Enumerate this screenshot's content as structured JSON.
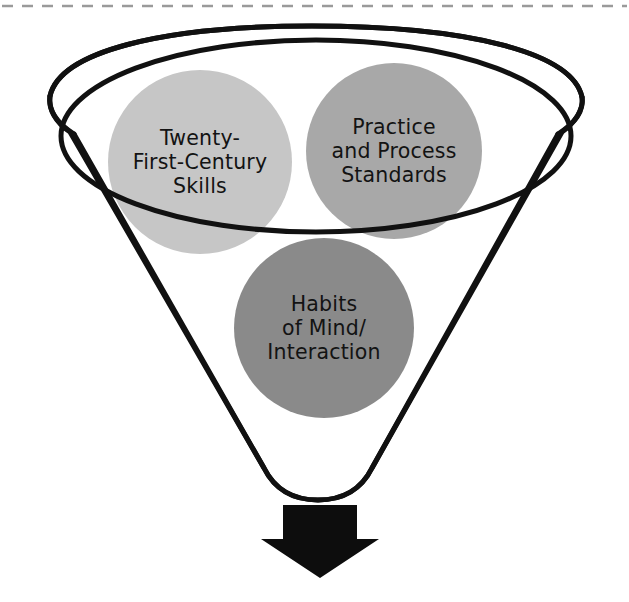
{
  "diagram": {
    "background_color": "#ffffff",
    "outline_color": "#111111",
    "top_border": {
      "style": "dashed",
      "color": "#9a9a9a",
      "name": "page-edge-dashed-rule"
    },
    "funnel": {
      "name": "funnel-shape",
      "stroke_color": "#111111",
      "stroke_width": 5,
      "fill": "#ffffff",
      "rim_ellipse_name": "funnel-rim-ellipse"
    },
    "arrow": {
      "name": "output-arrow",
      "direction": "down",
      "color": "#0d0d0d"
    },
    "circles": [
      {
        "id": "twenty-first-century-skills",
        "name": "circle-twenty-first-century-skills",
        "color": "#c6c6c6",
        "cx": 200,
        "cy": 162,
        "r": 92,
        "lines": [
          "Twenty-",
          "First-Century",
          "Skills"
        ],
        "text_color": "#131313"
      },
      {
        "id": "practice-and-process-standards",
        "name": "circle-practice-and-process-standards",
        "color": "#a8a8a8",
        "cx": 394,
        "cy": 151,
        "r": 88,
        "lines": [
          "Practice",
          "and Process",
          "Standards"
        ],
        "text_color": "#131313"
      },
      {
        "id": "habits-of-mind-interaction",
        "name": "circle-habits-of-mind-interaction",
        "color": "#8a8a8a",
        "cx": 324,
        "cy": 328,
        "r": 90,
        "lines": [
          "Habits",
          "of Mind/",
          "Interaction"
        ],
        "text_color": "#131313"
      }
    ]
  }
}
